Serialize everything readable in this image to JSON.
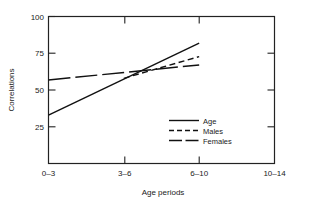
{
  "chart_data": {
    "type": "line",
    "title": "",
    "xlabel": "Age periods",
    "ylabel": "Correlations",
    "categories": [
      "0–3",
      "3–6",
      "6–10",
      "10–14"
    ],
    "ytick_labels": [
      "100",
      "75",
      "50",
      "25"
    ],
    "ytick_values": [
      100,
      75,
      50,
      25
    ],
    "ylim": [
      12,
      100
    ],
    "xlim": [
      0,
      3
    ],
    "grid": false,
    "legend_position": "inside-lower-right",
    "series": [
      {
        "name": "Age",
        "style": "solid",
        "x": [
          "0–3",
          "6–10"
        ],
        "values": [
          41,
          84
        ]
      },
      {
        "name": "Males",
        "style": "dashed",
        "x": [
          "3–6",
          "6–10"
        ],
        "values": [
          63,
          76
        ]
      },
      {
        "name": "Females",
        "style": "long-dash",
        "x": [
          "0–3",
          "6–10"
        ],
        "values": [
          62,
          71
        ]
      }
    ]
  },
  "axes": {
    "y_title": "Correlations",
    "x_title": "Age periods",
    "y_ticks": [
      {
        "label": "100",
        "value": 100
      },
      {
        "label": "75",
        "value": 75
      },
      {
        "label": "50",
        "value": 50
      },
      {
        "label": "25",
        "value": 25
      }
    ],
    "x_ticks": [
      {
        "label": "0–3"
      },
      {
        "label": "3–6"
      },
      {
        "label": "6–10"
      },
      {
        "label": "10–14"
      }
    ]
  },
  "legend": {
    "entries": [
      {
        "label": "Age",
        "style": "solid"
      },
      {
        "label": "Males",
        "style": "dashed"
      },
      {
        "label": "Females",
        "style": "long-dash"
      }
    ]
  },
  "colors": {
    "line": "#111111",
    "frame": "#222222",
    "background": "#ffffff",
    "text": "#1a1a1a"
  }
}
